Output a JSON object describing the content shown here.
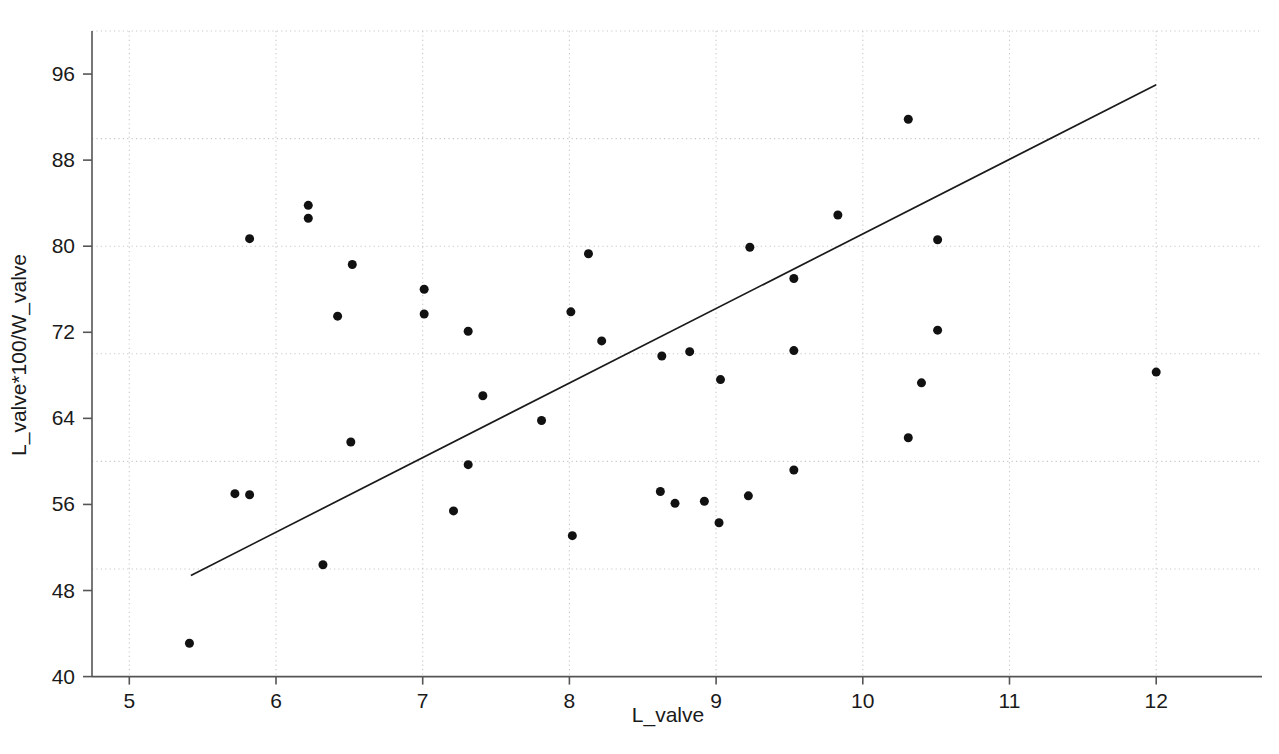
{
  "chart_data": {
    "type": "scatter",
    "title": "",
    "subtitle": "",
    "xlabel": "L_valve",
    "ylabel": "L_valve*100/W_valve",
    "xlim": [
      4.62,
      12.45
    ],
    "ylim": [
      40,
      100.6
    ],
    "x_ticks": [
      5,
      6,
      7,
      8,
      9,
      10,
      11,
      12
    ],
    "x_tick_labels": [
      "5",
      "6",
      "7",
      "8",
      "9",
      "10",
      "11",
      "12"
    ],
    "y_ticks": [
      40,
      48,
      56,
      64,
      72,
      80,
      88,
      96
    ],
    "y_tick_labels": [
      "40",
      "48",
      "56",
      "64",
      "72",
      "80",
      "88",
      "96"
    ],
    "grid": true,
    "grid_style": "dotted",
    "grid_color": "#c8c8c8",
    "x_gridlines": [
      5,
      6,
      7,
      8,
      9,
      10,
      11,
      12
    ],
    "y_gridlines": [
      50,
      60,
      70,
      80,
      90,
      100
    ],
    "legend": null,
    "marker": {
      "shape": "circle",
      "color": "#111111",
      "size": 9
    },
    "point_color": "#111111",
    "line_color": "#1a1a1a",
    "axis_color": "#555555",
    "background": "#ffffff",
    "points": [
      {
        "x": 5.41,
        "y": 43.1
      },
      {
        "x": 5.72,
        "y": 57.0
      },
      {
        "x": 5.82,
        "y": 56.9
      },
      {
        "x": 5.82,
        "y": 80.7
      },
      {
        "x": 6.22,
        "y": 83.8
      },
      {
        "x": 6.22,
        "y": 82.6
      },
      {
        "x": 6.32,
        "y": 50.4
      },
      {
        "x": 6.42,
        "y": 73.5
      },
      {
        "x": 6.51,
        "y": 61.8
      },
      {
        "x": 6.52,
        "y": 78.3
      },
      {
        "x": 7.01,
        "y": 76.0
      },
      {
        "x": 7.01,
        "y": 73.7
      },
      {
        "x": 7.21,
        "y": 55.4
      },
      {
        "x": 7.31,
        "y": 72.1
      },
      {
        "x": 7.31,
        "y": 59.7
      },
      {
        "x": 7.41,
        "y": 66.1
      },
      {
        "x": 7.81,
        "y": 63.8
      },
      {
        "x": 8.01,
        "y": 73.9
      },
      {
        "x": 8.02,
        "y": 53.1
      },
      {
        "x": 8.13,
        "y": 79.3
      },
      {
        "x": 8.22,
        "y": 71.2
      },
      {
        "x": 8.62,
        "y": 57.2
      },
      {
        "x": 8.63,
        "y": 69.8
      },
      {
        "x": 8.72,
        "y": 56.1
      },
      {
        "x": 8.82,
        "y": 70.2
      },
      {
        "x": 8.92,
        "y": 56.3
      },
      {
        "x": 9.02,
        "y": 54.3
      },
      {
        "x": 9.03,
        "y": 67.6
      },
      {
        "x": 9.22,
        "y": 56.8
      },
      {
        "x": 9.23,
        "y": 79.9
      },
      {
        "x": 9.53,
        "y": 77.0
      },
      {
        "x": 9.53,
        "y": 70.3
      },
      {
        "x": 9.53,
        "y": 59.2
      },
      {
        "x": 9.83,
        "y": 82.9
      },
      {
        "x": 10.31,
        "y": 91.8
      },
      {
        "x": 10.31,
        "y": 62.2
      },
      {
        "x": 10.4,
        "y": 67.3
      },
      {
        "x": 10.51,
        "y": 80.6
      },
      {
        "x": 10.51,
        "y": 72.2
      },
      {
        "x": 12.0,
        "y": 68.3
      }
    ],
    "fit_line": {
      "label": "regression line",
      "x_start": 5.42,
      "y_start": 49.4,
      "x_end": 12.0,
      "y_end": 95.0
    }
  }
}
